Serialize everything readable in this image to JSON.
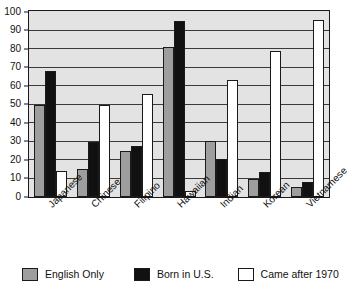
{
  "chart_data": {
    "type": "bar",
    "title": "",
    "subtitle": "",
    "xlabel": "",
    "ylabel": "",
    "ylim": [
      0,
      100
    ],
    "ytick_step": 10,
    "yticks": [
      100,
      90,
      80,
      70,
      60,
      50,
      40,
      30,
      20,
      10,
      0
    ],
    "grid": true,
    "legend_position": "bottom",
    "categories": [
      "Japanese",
      "Chinese",
      "Filipino",
      "Hawaiian",
      "Indian",
      "Korean",
      "Vietnamese"
    ],
    "series": [
      {
        "name": "English Only",
        "color": "#9e9e9e",
        "values": [
          50,
          15,
          25,
          81,
          30.5,
          10,
          5.5
        ]
      },
      {
        "name": "Born in U.S.",
        "color": "#111111",
        "values": [
          68,
          29.5,
          27.5,
          95,
          20.5,
          13.5,
          8
        ]
      },
      {
        "name": "Came after 1970",
        "color": "#ffffff",
        "values": [
          14,
          50,
          55.5,
          3,
          63.5,
          79,
          95.5
        ]
      }
    ]
  },
  "legend": {
    "items": [
      {
        "label": "English Only",
        "swatch": "english"
      },
      {
        "label": "Born in U.S.",
        "swatch": "born"
      },
      {
        "label": "Came after 1970",
        "swatch": "came"
      }
    ]
  }
}
